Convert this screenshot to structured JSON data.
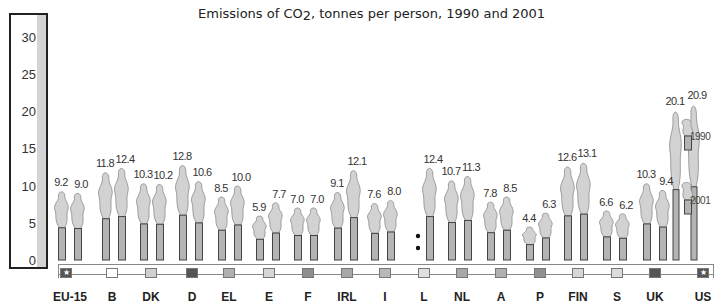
{
  "title": "Emissions of CO2, tonnes per person, 1990 and 2001",
  "title_parts": {
    "prefix": "Emissions of CO",
    "subscript": "2",
    "suffix": ", tonnes per person, 1990 and 2001"
  },
  "yaxis": {
    "ticks": [
      "0",
      "5",
      "10",
      "15",
      "20",
      "25",
      "30"
    ]
  },
  "legend": {
    "items": [
      {
        "label": "1990"
      },
      {
        "label": "2001"
      }
    ]
  },
  "chart_data": {
    "type": "bar",
    "title": "Emissions of CO2, tonnes per person, 1990 and 2001",
    "xlabel": "",
    "ylabel": "tonnes per person",
    "ylim": [
      0,
      30
    ],
    "yticks": [
      0,
      5,
      10,
      15,
      20,
      25,
      30
    ],
    "grid": false,
    "legend_position": "right",
    "categories": [
      "EU-15",
      "B",
      "DK",
      "D",
      "EL",
      "E",
      "F",
      "IRL",
      "I",
      "L",
      "NL",
      "A",
      "P",
      "FIN",
      "S",
      "UK",
      "US"
    ],
    "series": [
      {
        "name": "1990",
        "values": [
          9.2,
          11.8,
          10.3,
          12.8,
          8.5,
          5.9,
          7.0,
          9.1,
          7.6,
          null,
          10.7,
          7.8,
          4.4,
          12.6,
          6.6,
          10.3,
          20.1
        ]
      },
      {
        "name": "2001",
        "values": [
          9.0,
          12.4,
          10.2,
          10.6,
          10.0,
          7.7,
          7.0,
          12.1,
          8.0,
          12.4,
          11.3,
          8.5,
          6.3,
          13.1,
          6.2,
          9.4,
          20.9
        ]
      }
    ],
    "labels": [
      [
        "9.2",
        "9.0"
      ],
      [
        "11.8",
        "12.4"
      ],
      [
        "10.3",
        "10.2"
      ],
      [
        "12.8",
        "10.6"
      ],
      [
        "8.5",
        "10.0"
      ],
      [
        "5.9",
        "7.7"
      ],
      [
        "7.0",
        "7.0"
      ],
      [
        "9.1",
        "12.1"
      ],
      [
        "7.6",
        "8.0"
      ],
      [
        ":",
        "12.4"
      ],
      [
        "10.7",
        "11.3"
      ],
      [
        "7.8",
        "8.5"
      ],
      [
        "4.4",
        "6.3"
      ],
      [
        "12.6",
        "13.1"
      ],
      [
        "6.6",
        "6.2"
      ],
      [
        "10.3",
        "9.4"
      ],
      [
        "20.1",
        "20.9"
      ]
    ],
    "annotations": [
      "L 1990 value not available (shown as ':')"
    ],
    "category_colors": [
      "#555555",
      "#ffffff",
      "#d0d0d0",
      "#555555",
      "#b0b0b0",
      "#d6d6d6",
      "#8e8e8e",
      "#a8a8a8",
      "#b8b8b8",
      "#e0e0e0",
      "#a8a8a8",
      "#b0b0b0",
      "#909090",
      "#d6d6d6",
      "#dcdcdc",
      "#555555",
      "#555555"
    ],
    "style": "chimney pictogram: grey chimney stack topped by smoke plume"
  },
  "colors": {
    "bar": "#b4b4b4",
    "bar_stroke": "#444444",
    "smoke": "#d2d2d2",
    "smoke_stroke": "#8a8a8a",
    "axis_stripe": "#d4d4d4"
  }
}
